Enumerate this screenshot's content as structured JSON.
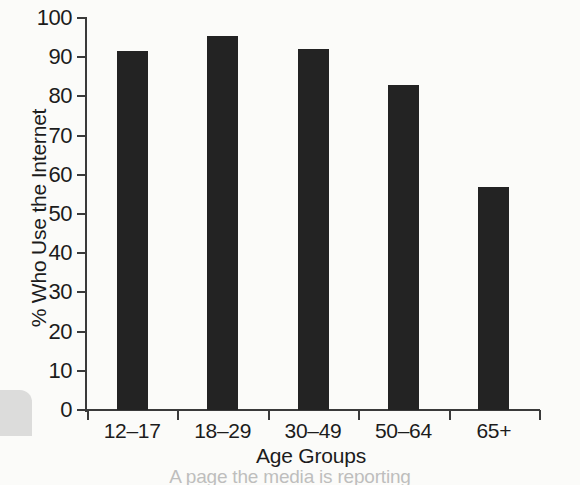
{
  "chart_data": {
    "type": "bar",
    "title": "",
    "categories": [
      "12–17",
      "18–29",
      "30–49",
      "50–64",
      "65+"
    ],
    "values": [
      91.5,
      95.5,
      92,
      83,
      57
    ],
    "xlabel": "Age Groups",
    "ylabel": "% Who Use the Internet",
    "ylim": [
      0,
      100
    ],
    "yticks": [
      0,
      10,
      20,
      30,
      40,
      50,
      60,
      70,
      80,
      90,
      100
    ],
    "ytick_labels": [
      "0",
      "10",
      "20",
      "30",
      "40",
      "50",
      "60",
      "70",
      "80",
      "90",
      "100"
    ],
    "grid": false,
    "legend": null,
    "bar_color": "#232323",
    "background_color": "#fbfbf9",
    "axis_color": "#3a3a3a"
  },
  "caption": {
    "partial_text": "A page the media is reporting"
  }
}
